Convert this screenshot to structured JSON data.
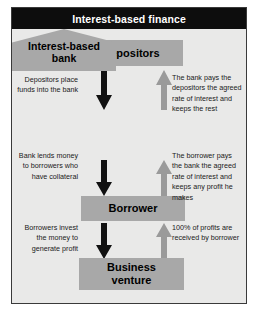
{
  "figure": {
    "title": "Interest-based finance",
    "frame_border_color": "#3a3a3a",
    "title_bar_color": "#0d0d0d",
    "title_text_color": "#ffffff",
    "canvas_color": "#e9e9e8",
    "node_fill_color": "#a8a8a8",
    "down_arrow_color": "#111111",
    "up_arrow_color": "#9a9a9a"
  },
  "nodes": {
    "depositors": "Depositors",
    "bank_line1": "Interest-based",
    "bank_line2": "bank",
    "borrower": "Borrower",
    "venture_line1": "Business",
    "venture_line2": "venture"
  },
  "captions": {
    "left_1": "Depositors place funds into the bank",
    "right_1": "The bank pays the depositors the agreed rate of interest and keeps the rest",
    "left_2": "Bank lends money to borrowers who have collateral",
    "right_2": "The borrower pays the bank the agreed rate of interest and keeps any profit he makes",
    "left_3": "Borrowers invest the money to generate profit",
    "right_3": "100% of profits are received by borrower"
  },
  "arrows": {
    "down_1": "arrow-down-icon",
    "up_1": "arrow-up-icon",
    "down_2": "arrow-down-icon",
    "up_2": "arrow-up-icon",
    "down_3": "arrow-down-icon",
    "up_3": "arrow-up-icon"
  }
}
